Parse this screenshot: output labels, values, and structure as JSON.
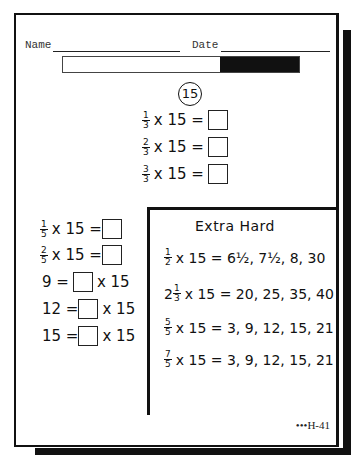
{
  "header": {
    "name_label": "Name",
    "date_label": "Date"
  },
  "progress": {
    "filled_fraction": 0.33,
    "fill_color": "#111111"
  },
  "section_number": "15",
  "main_problems": [
    {
      "num": "1",
      "den": "3",
      "text": "x 15 ="
    },
    {
      "num": "2",
      "den": "3",
      "text": "x 15 ="
    },
    {
      "num": "3",
      "den": "3",
      "text": "x 15 ="
    }
  ],
  "left_problems": [
    {
      "num": "1",
      "den": "5",
      "text": "x 15 ="
    },
    {
      "num": "2",
      "den": "5",
      "text": "x 15 ="
    }
  ],
  "reverse_problems": [
    {
      "lhs": "9 =",
      "rhs": "x 15"
    },
    {
      "lhs": "12 =",
      "rhs": "x 15"
    },
    {
      "lhs": "15 =",
      "rhs": "x 15"
    }
  ],
  "extra_hard": {
    "title": "Extra Hard",
    "problems": [
      {
        "whole": "",
        "num": "1",
        "den": "2",
        "text": "x 15 = 6½, 7½, 8, 30"
      },
      {
        "whole": "2",
        "num": "1",
        "den": "3",
        "text": "x 15 = 20, 25, 35, 40"
      },
      {
        "whole": "",
        "num": "5",
        "den": "5",
        "text": "x 15 = 3, 9, 12, 15, 21"
      },
      {
        "whole": "",
        "num": "7",
        "den": "5",
        "text": "x 15 = 3, 9, 12, 15, 21"
      }
    ]
  },
  "footer": {
    "code": "•••H-41"
  }
}
